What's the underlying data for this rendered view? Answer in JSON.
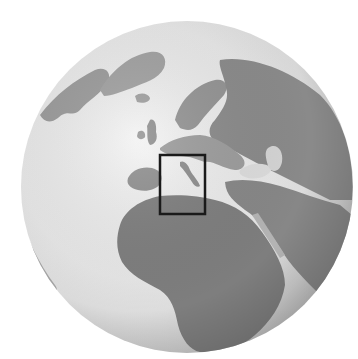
{
  "map": {
    "projection": "orthographic",
    "center_region": "Europe / Mediterranean",
    "style": "grayscale relief globe",
    "globe": {
      "cx": 187,
      "cy": 187,
      "r": 166
    },
    "colors": {
      "background": "#ffffff",
      "ocean_light": "#f2f2f2",
      "ocean_mid": "#e0e0e0",
      "ocean_dark": "#bdbdbd",
      "land_light": "#a8a8a8",
      "land": "#8c8c8c",
      "land_dark": "#747474",
      "highlight_box": "#1a1a1a"
    },
    "highlight_box": {
      "label": "Italy",
      "x": 160,
      "y": 155,
      "width": 45,
      "height": 59,
      "stroke_width": 2.5
    },
    "regions": [
      "Greenland",
      "Iceland",
      "British Isles",
      "Scandinavia",
      "Europe",
      "Russia",
      "Iberia",
      "Italy",
      "Black Sea",
      "Caspian Sea",
      "Africa",
      "Arabian Peninsula",
      "Mediterranean Sea",
      "Red Sea",
      "South America (edge)"
    ]
  }
}
